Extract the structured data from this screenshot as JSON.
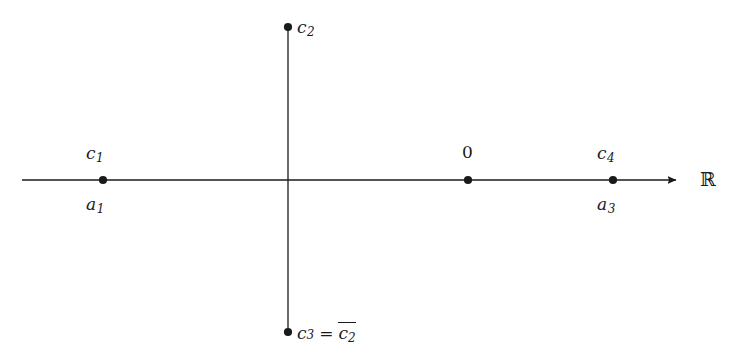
{
  "figure": {
    "background_color": "#ffffff",
    "stroke_color": "#1a1a1a",
    "axis_label": "ℝ",
    "axis_label_name": "real-axis-symbol"
  },
  "axes": {
    "real": {
      "name": "real-axis",
      "x_start": 22,
      "x_end": 683,
      "y": 180,
      "has_arrow": true,
      "arrow_direction": "right"
    },
    "imaginary": {
      "name": "imaginary-axis",
      "x": 288,
      "y_top": 27,
      "y_bottom": 332,
      "has_arrow": false
    }
  },
  "points": [
    {
      "id": "c1",
      "name": "point-c1",
      "x": 103,
      "y": 180,
      "label_above": "c",
      "label_above_sub": "1",
      "label_below": "a",
      "label_below_sub": "1",
      "on_axis": "real"
    },
    {
      "id": "c2",
      "name": "point-c2",
      "x": 288,
      "y": 27,
      "label_right": "c",
      "label_right_sub": "2",
      "on_axis": "imaginary"
    },
    {
      "id": "origin",
      "name": "point-origin",
      "x": 468,
      "y": 180,
      "label_above": "0",
      "on_axis": "real"
    },
    {
      "id": "c4",
      "name": "point-c4",
      "x": 613,
      "y": 180,
      "label_above": "c",
      "label_above_sub": "4",
      "label_below": "a",
      "label_below_sub": "3",
      "on_axis": "real"
    },
    {
      "id": "c3",
      "name": "point-c3",
      "x": 288,
      "y": 332,
      "label_right_equation": true,
      "on_axis": "imaginary"
    }
  ],
  "labels": {
    "c1_above": "c",
    "c1_above_sub": "1",
    "c1_below": "a",
    "c1_below_sub": "1",
    "c2": "c",
    "c2_sub": "2",
    "origin": "0",
    "c4_above": "c",
    "c4_above_sub": "4",
    "c4_below": "a",
    "c4_below_sub": "3",
    "c3_lhs": "c",
    "c3_lhs_sub": "3",
    "c3_equals": "=",
    "c3_rhs": "c",
    "c3_rhs_sub": "2",
    "real_symbol": "ℝ"
  }
}
